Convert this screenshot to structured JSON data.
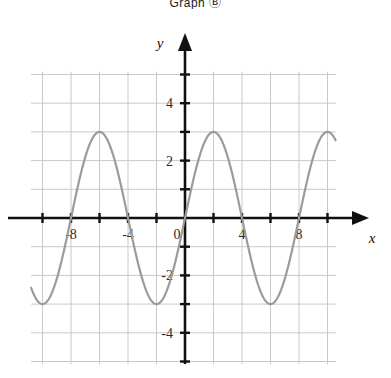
{
  "page": {
    "background_color": "#ffffff",
    "clipped_header_text": "Graph Ⓑ"
  },
  "chart_data": {
    "type": "line",
    "title": "",
    "subtitle": "",
    "xlabel": "x",
    "ylabel": "y",
    "function": "y = 3 sin(pi x / 4)",
    "amplitude": 3,
    "period": 8,
    "phase_shift": 0,
    "vertical_shift": 0,
    "xlim": [
      -10.8,
      10.6
    ],
    "ylim": [
      -5.1,
      5.1
    ],
    "x_ticks": [
      -10,
      -8,
      -6,
      -4,
      -2,
      0,
      2,
      4,
      6,
      8,
      10
    ],
    "y_ticks": [
      -5,
      -4,
      -3,
      -2,
      -1,
      0,
      1,
      2,
      3,
      4,
      5
    ],
    "x_tick_labels": [
      "-8",
      "-4",
      "0",
      "4",
      "8"
    ],
    "x_tick_label_values": [
      -8,
      -4,
      0,
      4,
      8
    ],
    "y_tick_labels": [
      "4",
      "2",
      "0",
      "-2",
      "-4"
    ],
    "y_tick_label_values": [
      4,
      2,
      0,
      -2,
      -4
    ],
    "grid": true,
    "grid_step_x": 2,
    "grid_step_y": 1,
    "legend": "none",
    "axis_arrows": [
      "up",
      "right"
    ],
    "curve_color": "#9b9b9b",
    "curve_width": 2.2,
    "grid_color": "#c9c9c9",
    "axis_color": "#111111",
    "key_points": {
      "zeros": [
        -8,
        -4,
        0,
        4,
        8
      ],
      "maxima": [
        {
          "x": -10,
          "y": 3
        },
        {
          "x": -6,
          "y": 3
        },
        {
          "x": -2,
          "y": 3
        },
        {
          "x": 2,
          "y": 3
        },
        {
          "x": 6,
          "y": 3
        },
        {
          "x": 10,
          "y": 3
        }
      ],
      "minima": [
        {
          "x": -8,
          "y": -3
        },
        {
          "x": -4,
          "y": -3
        },
        {
          "x": 0,
          "y": -3
        }
      ]
    },
    "series": [
      {
        "name": "y = 3 sin(pi x / 4)",
        "color": "#9b9b9b",
        "x_start": -10.8,
        "x_end": 10.6
      }
    ]
  }
}
